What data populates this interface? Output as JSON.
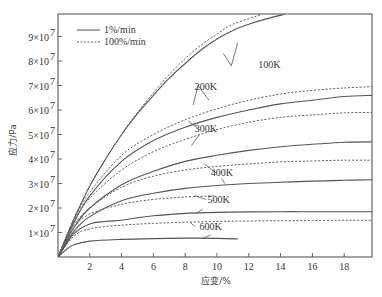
{
  "chart_data": {
    "type": "line",
    "title": "",
    "xlabel": "应变/%",
    "ylabel": "应力/Pa",
    "xlim": [
      0,
      19.8
    ],
    "ylim": [
      0,
      99000000.0
    ],
    "xticks": [
      2,
      4,
      6,
      8,
      10,
      12,
      14,
      16,
      18
    ],
    "xtick_labels": [
      "2",
      "4",
      "6",
      "8",
      "10",
      "12",
      "14",
      "16",
      "18"
    ],
    "yticks": [
      10000000.0,
      20000000.0,
      30000000.0,
      40000000.0,
      50000000.0,
      60000000.0,
      70000000.0,
      80000000.0,
      90000000.0
    ],
    "ytick_labels": [
      "1×10",
      "2×10",
      "3×10",
      "4×10",
      "5×10",
      "6×10",
      "7×10",
      "8×10",
      "9×10"
    ],
    "ytick_exponent": "7",
    "grid": false,
    "legend": {
      "position": "upper left",
      "entries": [
        {
          "label": "1%/min",
          "style": "solid"
        },
        {
          "label": "100%/min",
          "style": "dashed"
        }
      ]
    },
    "series": [
      {
        "name": "100K 1%/min",
        "style": "solid",
        "x": [
          0,
          1,
          2,
          3,
          4,
          5,
          6,
          7,
          8,
          9,
          10,
          11,
          12,
          13,
          14.2
        ],
        "y": [
          0,
          15500000.0,
          29000000.0,
          40000000.0,
          50000000.0,
          58500000.0,
          66000000.0,
          73000000.0,
          79000000.0,
          84500000.0,
          89000000.0,
          92500000.0,
          95000000.0,
          97000000.0,
          99000000.0
        ]
      },
      {
        "name": "100K 100%/min",
        "style": "dashed",
        "x": [
          0,
          1,
          2,
          3,
          4,
          5,
          6,
          7,
          8,
          9,
          10,
          11,
          12.8
        ],
        "y": [
          0,
          15500000.0,
          29000000.0,
          40000000.0,
          50000000.0,
          59000000.0,
          67000000.0,
          74500000.0,
          81000000.0,
          86500000.0,
          91000000.0,
          95000000.0,
          99000000.0
        ]
      },
      {
        "name": "200K 1%/min",
        "style": "solid",
        "x": [
          0,
          1,
          2,
          4,
          6,
          8,
          10,
          12,
          14,
          16,
          18,
          19.8
        ],
        "y": [
          0,
          14000000.0,
          25000000.0,
          39000000.0,
          47500000.0,
          53000000.0,
          57000000.0,
          60000000.0,
          62500000.0,
          64000000.0,
          65500000.0,
          66000000.0
        ]
      },
      {
        "name": "200K 100%/min",
        "style": "dashed",
        "x": [
          0,
          1,
          2,
          4,
          6,
          8,
          10,
          12,
          14,
          16,
          18,
          19.8
        ],
        "y": [
          0,
          15000000.0,
          26500000.0,
          41500000.0,
          50000000.0,
          56000000.0,
          60500000.0,
          64000000.0,
          66500000.0,
          68000000.0,
          69000000.0,
          69500000.0
        ]
      },
      {
        "name": "300K 1%/min",
        "style": "solid",
        "x": [
          0,
          1,
          2,
          4,
          6,
          8,
          10,
          12,
          14,
          16,
          18,
          19.8
        ],
        "y": [
          0,
          12000000.0,
          20000000.0,
          29500000.0,
          35000000.0,
          39000000.0,
          41500000.0,
          43500000.0,
          45000000.0,
          46000000.0,
          46800000.0,
          47000000.0
        ]
      },
      {
        "name": "300K 100%/min",
        "style": "dashed",
        "x": [
          0,
          1,
          2,
          4,
          6,
          8,
          10,
          12,
          14,
          16,
          18,
          19.8
        ],
        "y": [
          0,
          14500000.0,
          24000000.0,
          35500000.0,
          43000000.0,
          48000000.0,
          52000000.0,
          55000000.0,
          57000000.0,
          58000000.0,
          58800000.0,
          59000000.0
        ]
      },
      {
        "name": "400K 1%/min",
        "style": "solid",
        "x": [
          0,
          1,
          2,
          4,
          6,
          8,
          10,
          12,
          14,
          16,
          18,
          19.8
        ],
        "y": [
          0,
          10500000.0,
          16500000.0,
          23000000.0,
          26000000.0,
          28000000.0,
          29200000.0,
          30000000.0,
          30500000.0,
          31000000.0,
          31300000.0,
          31500000.0
        ]
      },
      {
        "name": "400K 100%/min",
        "style": "dashed",
        "x": [
          0,
          1,
          2,
          4,
          6,
          8,
          10,
          12,
          14,
          16,
          18,
          19.8
        ],
        "y": [
          0,
          13000000.0,
          20000000.0,
          28500000.0,
          33000000.0,
          35500000.0,
          37000000.0,
          38000000.0,
          38800000.0,
          39200000.0,
          39500000.0,
          39500000.0
        ]
      },
      {
        "name": "500K 1%/min",
        "style": "solid",
        "x": [
          0,
          1,
          2,
          3,
          4,
          5,
          6,
          8,
          10,
          12,
          14,
          16,
          18,
          19.8
        ],
        "y": [
          0,
          9500000.0,
          13500000.0,
          14500000.0,
          15000000.0,
          16000000.0,
          16800000.0,
          17800000.0,
          18200000.0,
          18400000.0,
          18500000.0,
          18500000.0,
          18500000.0,
          18500000.0
        ]
      },
      {
        "name": "500K 100%/min",
        "style": "dashed",
        "x": [
          0,
          1,
          2,
          4,
          6,
          8,
          9.8
        ],
        "y": [
          0,
          12000000.0,
          17500000.0,
          21500000.0,
          23500000.0,
          24500000.0,
          25000000.0
        ]
      },
      {
        "name": "600K 1%/min",
        "style": "solid",
        "x": [
          0,
          0.5,
          1,
          2,
          4,
          6,
          8,
          10,
          11.3
        ],
        "y": [
          0,
          3000000.0,
          5000000.0,
          6500000.0,
          7200000.0,
          7500000.0,
          7700000.0,
          7600000.0,
          7400000.0
        ]
      },
      {
        "name": "600K 100%/min",
        "style": "dashed",
        "x": [
          0,
          1,
          2,
          4,
          6,
          8,
          10,
          12,
          14,
          16,
          18,
          19.8
        ],
        "y": [
          0,
          8500000.0,
          11500000.0,
          13000000.0,
          13700000.0,
          14200000.0,
          14500000.0,
          14700000.0,
          14800000.0,
          14900000.0,
          15000000.0,
          15000000.0
        ]
      }
    ],
    "annotations": [
      {
        "text": "100K",
        "x": 12.6,
        "y": 77000000.0
      },
      {
        "text": "200K",
        "x": 8.6,
        "y": 68000000.0
      },
      {
        "text": "300K",
        "x": 8.6,
        "y": 51000000.0
      },
      {
        "text": "400K",
        "x": 9.6,
        "y": 33000000.0
      },
      {
        "text": "500K",
        "x": 9.4,
        "y": 22000000.0
      },
      {
        "text": "600K",
        "x": 8.9,
        "y": 11000000.0
      }
    ]
  }
}
